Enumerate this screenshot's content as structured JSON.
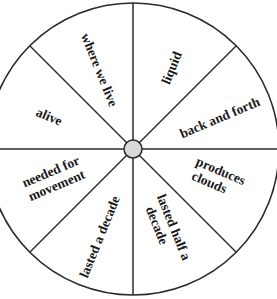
{
  "wheel": {
    "center": {
      "x": 133,
      "y": 149
    },
    "radius": 146,
    "hub_radius": 9,
    "colors": {
      "stroke": "#2a2a2a",
      "hub_fill": "#d9d9d9",
      "text": "#1a1a1a",
      "background": "#ffffff"
    },
    "sectors": [
      {
        "position": "top-left",
        "lines": [
          "where we live"
        ]
      },
      {
        "position": "top-right",
        "lines": [
          "liquid"
        ]
      },
      {
        "position": "upper-right",
        "lines": [
          "back and forth"
        ]
      },
      {
        "position": "lower-right",
        "lines": [
          "produces",
          "clouds"
        ]
      },
      {
        "position": "bottom-right",
        "lines": [
          "lasted half a",
          "decade"
        ]
      },
      {
        "position": "bottom-left",
        "lines": [
          "lasted a decade"
        ]
      },
      {
        "position": "lower-left",
        "lines": [
          "needed for",
          "movement"
        ]
      },
      {
        "position": "upper-left",
        "lines": [
          "alive"
        ]
      }
    ]
  }
}
